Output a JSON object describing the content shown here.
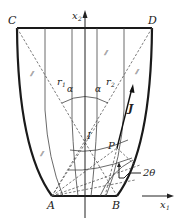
{
  "diagram": {
    "type": "slip-line field / flow diagram",
    "points": {
      "C": "C",
      "D": "D",
      "A": "A",
      "B": "B",
      "I": "I",
      "P": "P"
    },
    "axes": {
      "x1": "x",
      "x1_sub": "1",
      "x2": "x",
      "x2_sub": "2"
    },
    "vectors": {
      "J": "J"
    },
    "angles": {
      "alpha_left": "α",
      "alpha_right": "α",
      "two_theta": "2θ"
    },
    "radii": {
      "r1": "r",
      "r1_sub": "1",
      "r2": "r",
      "r2_sub": "2"
    },
    "hatch_marks": {
      "top_right": "⫽",
      "left_upper": "⫽",
      "right_upper": "⫽",
      "left_lower": "⫽"
    }
  }
}
